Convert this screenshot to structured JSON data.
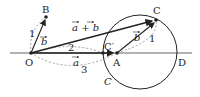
{
  "diagram": {
    "type": "vector-geometry",
    "points": {
      "O": {
        "label": "O",
        "x": 31,
        "y": 53
      },
      "B": {
        "label": "B",
        "x": 46,
        "y": 17
      },
      "A": {
        "label": "A",
        "x": 117,
        "y": 53
      },
      "C": {
        "label": "C",
        "x": 156,
        "y": 20
      },
      "Cprime": {
        "label": "C′",
        "x": 103,
        "y": 53
      },
      "D": {
        "label": "D",
        "x": 176,
        "y": 53
      }
    },
    "circle": {
      "label": "C",
      "cx": 140,
      "cy": 52,
      "r": 37
    },
    "labels": {
      "vec_b_left": "b",
      "vec_b_right": "b",
      "vec_a": "a",
      "vec_a_plus_b": "a + b",
      "len_1_left": "1",
      "len_1_right": "1",
      "len_2": "2",
      "len_3": "3"
    },
    "colors": {
      "stroke": "#222222",
      "dashed": "#888888",
      "axis": "#666666"
    }
  }
}
